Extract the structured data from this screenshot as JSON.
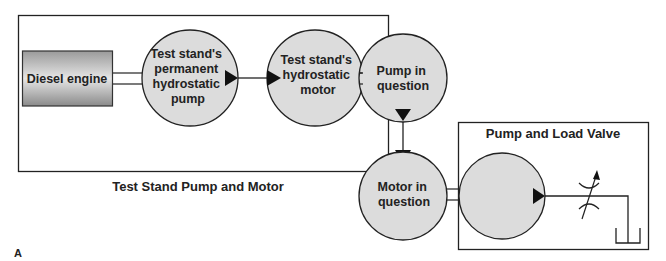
{
  "figure_label": "A",
  "groups": {
    "test_stand": {
      "title": "Test Stand Pump and Motor"
    },
    "pump_load": {
      "title": "Pump and Load Valve"
    }
  },
  "components": {
    "diesel_engine": {
      "label": "Diesel engine"
    },
    "test_pump": {
      "lines": [
        "Test stand's",
        "permanent",
        "hydrostatic",
        "pump"
      ]
    },
    "test_motor": {
      "lines": [
        "Test stand's",
        "hydrostatic",
        "motor"
      ]
    },
    "pump_in_question": {
      "lines": [
        "Pump in",
        "question"
      ]
    },
    "motor_in_question": {
      "lines": [
        "Motor in",
        "question"
      ]
    },
    "load_pump": {
      "lines": []
    },
    "load_valve": {
      "symbol": "variable-restrictor-icon"
    },
    "reservoir": {
      "symbol": "tank-icon"
    }
  },
  "colors": {
    "circle_fill": "#dcdcdc",
    "stroke": "#222222",
    "engine_gradient_top": "#9a9a9a",
    "engine_gradient_mid": "#e8e8e8",
    "engine_gradient_bottom": "#8c8c8c"
  }
}
